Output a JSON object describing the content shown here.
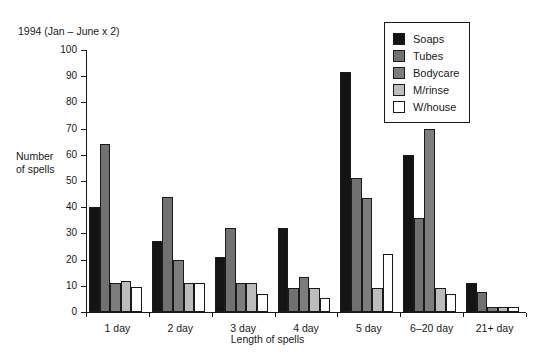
{
  "chart_data": {
    "type": "bar",
    "title": "1994 (Jan – June x 2)",
    "xlabel": "Length of spells",
    "ylabel": "Number\nof spells",
    "ylabel_line1": "Number",
    "ylabel_line2": "of spells",
    "ylim": [
      0,
      100
    ],
    "yticks": [
      0,
      10,
      20,
      30,
      40,
      50,
      60,
      70,
      80,
      90,
      100
    ],
    "ytick_labels": [
      "0",
      "10",
      "20",
      "30",
      "40",
      "50",
      "60",
      "70",
      "80",
      "90",
      "100"
    ],
    "grid": false,
    "legend_position": "top-right",
    "categories": [
      "1 day",
      "2 day",
      "3 day",
      "4 day",
      "5 day",
      "6–20 day",
      "21+ day"
    ],
    "series": [
      {
        "name": "Soaps",
        "color": "#141414",
        "values": [
          40,
          27,
          21,
          32,
          91.5,
          60,
          11
        ]
      },
      {
        "name": "Tubes",
        "color": "#717171",
        "values": [
          64,
          44,
          32,
          9,
          51,
          36,
          7.5
        ]
      },
      {
        "name": "Bodycare",
        "color": "#7d7d7d",
        "values": [
          11,
          20,
          11,
          13.5,
          43.5,
          70,
          2
        ]
      },
      {
        "name": "M/rinse",
        "color": "#bcbcbc",
        "values": [
          12,
          11,
          11,
          9,
          9,
          9,
          2
        ]
      },
      {
        "name": "W/house",
        "color": "#ffffff",
        "values": [
          9.5,
          11,
          7,
          5.5,
          22,
          7,
          2
        ]
      }
    ]
  },
  "legend": {
    "items": [
      {
        "label": "Soaps",
        "color": "#141414"
      },
      {
        "label": "Tubes",
        "color": "#717171"
      },
      {
        "label": "Bodycare",
        "color": "#7d7d7d"
      },
      {
        "label": "M/rinse",
        "color": "#bcbcbc"
      },
      {
        "label": "W/house",
        "color": "#ffffff"
      }
    ]
  }
}
